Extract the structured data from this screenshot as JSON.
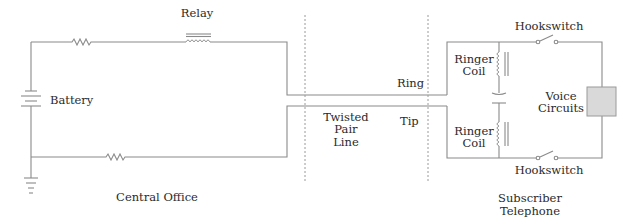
{
  "diagram": {
    "sections": {
      "central_office": "Central Office",
      "twisted_pair": [
        "Twisted",
        "Pair",
        "Line"
      ],
      "subscriber": [
        "Subscriber",
        "Telephone"
      ]
    },
    "components": {
      "relay": "Relay",
      "battery": "Battery",
      "ring": "Ring",
      "tip": "Tip",
      "ringer_coil_top": [
        "Ringer",
        "Coil"
      ],
      "ringer_coil_bottom": [
        "Ringer",
        "Coil"
      ],
      "voice_circuits": [
        "Voice",
        "Circuits"
      ],
      "hookswitch_top": "Hookswitch",
      "hookswitch_bottom": "Hookswitch"
    },
    "colors": {
      "wire": "#8a8a8a",
      "voice_box_fill": "#d9d9d9",
      "text": "#2a2a2a"
    }
  }
}
